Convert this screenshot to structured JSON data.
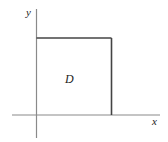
{
  "diagram": {
    "type": "region-in-plane",
    "axes": {
      "x_label": "x",
      "y_label": "y",
      "color": "#8a8a8a"
    },
    "region": {
      "label": "D",
      "shape": "rectangle",
      "edge_color": "#444444",
      "edges_drawn": [
        "top",
        "right"
      ],
      "edges_on_axes": [
        "left",
        "bottom"
      ]
    }
  }
}
